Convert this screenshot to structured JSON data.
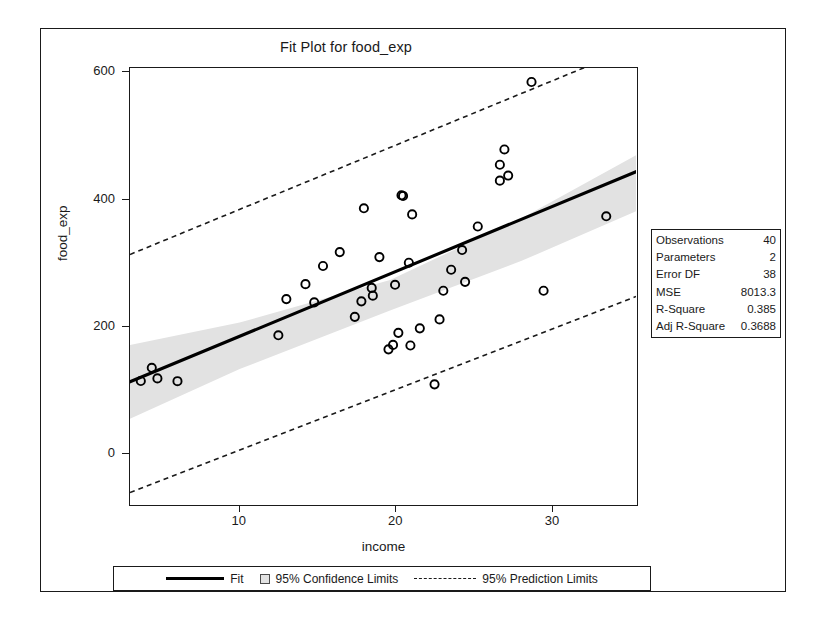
{
  "figure": {
    "title": "Fit Plot for food_exp"
  },
  "axes": {
    "xlabel": "income",
    "ylabel": "food_exp",
    "xticks": [
      10,
      20,
      30
    ],
    "yticks": [
      0,
      200,
      400,
      600
    ],
    "xlim": [
      3.0,
      35.3
    ],
    "ylim": [
      -78,
      607
    ]
  },
  "legend": {
    "position": "bottom",
    "items": [
      {
        "label": "Fit",
        "marker": "solid-line"
      },
      {
        "label": "95% Confidence Limits",
        "marker": "filled-square"
      },
      {
        "label": "95% Prediction Limits",
        "marker": "dashed-line"
      }
    ]
  },
  "stats": {
    "rows": [
      {
        "label": "Observations",
        "value": "40"
      },
      {
        "label": "Parameters",
        "value": "2"
      },
      {
        "label": "Error DF",
        "value": "38"
      },
      {
        "label": "MSE",
        "value": "8013.3"
      },
      {
        "label": "R-Square",
        "value": "0.385"
      },
      {
        "label": "Adj R-Square",
        "value": "0.3688"
      }
    ]
  },
  "colors": {
    "line": "#000000",
    "confidence_band": "#e2e2e2",
    "prediction_line": "#1a1a1a",
    "frame": "#1a1a1a",
    "background": "#ffffff"
  },
  "chart_data": {
    "type": "scatter",
    "title": "Fit Plot for food_exp",
    "xlabel": "income",
    "ylabel": "food_exp",
    "xlim": [
      3.0,
      35.3
    ],
    "ylim": [
      -78,
      607
    ],
    "grid": false,
    "legend_position": "bottom",
    "series": [
      {
        "name": "observations",
        "type": "scatter",
        "marker": "open-circle",
        "x": [
          3.69,
          4.39,
          4.75,
          6.03,
          12.47,
          12.98,
          14.2,
          14.76,
          15.32,
          16.39,
          17.35,
          17.77,
          17.93,
          18.43,
          18.5,
          18.92,
          19.5,
          19.79,
          19.92,
          20.13,
          20.33,
          20.43,
          20.9,
          21.01,
          21.5,
          22.44,
          22.76,
          23.0,
          23.5,
          24.2,
          24.39,
          25.2,
          26.61,
          26.61,
          26.9,
          27.14,
          28.63,
          29.4,
          33.4,
          20.8
        ],
        "y": [
          115.22,
          135.98,
          119.34,
          114.96,
          187.05,
          243.92,
          267.43,
          238.71,
          295.94,
          317.78,
          216.0,
          240.35,
          386.57,
          261.53,
          249.35,
          309.87,
          165.0,
          172.0,
          266.4,
          190.9,
          407.0,
          406.0,
          171.0,
          377.0,
          198.0,
          110.0,
          212.0,
          257.0,
          290.0,
          321.0,
          271.0,
          358.0,
          430.0,
          455.0,
          479.0,
          438.0,
          585.0,
          257.0,
          374.0,
          301.0
        ],
        "count": 40
      },
      {
        "name": "Fit",
        "type": "line",
        "style": "solid",
        "slope": 10.21,
        "intercept": 83.42,
        "x": [
          3.0,
          35.3
        ],
        "y": [
          114.0,
          444.0
        ]
      },
      {
        "name": "95% Confidence Limits",
        "type": "band",
        "x": [
          3.0,
          10.0,
          19.6,
          28.0,
          35.3
        ],
        "upper": [
          172.0,
          207.0,
          274.0,
          371.0,
          470.0
        ],
        "lower": [
          56.0,
          134.0,
          226.0,
          304.0,
          382.0
        ]
      },
      {
        "name": "95% Prediction Limits",
        "type": "band",
        "style": "dashed",
        "x": [
          3.0,
          35.3
        ],
        "upper": [
          314.0,
          641.0
        ],
        "lower": [
          -60.0,
          248.0
        ]
      }
    ]
  }
}
